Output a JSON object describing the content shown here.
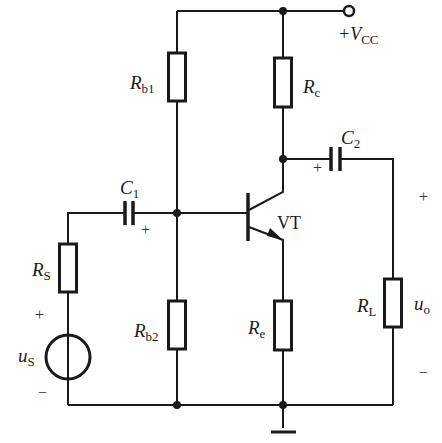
{
  "diagram": {
    "type": "circuit-schematic",
    "colors": {
      "ink": "#1a1a1a",
      "background": "#ffffff"
    },
    "labels": {
      "vcc": {
        "prefix": "+V",
        "sub": "CC"
      },
      "rb1": {
        "main": "R",
        "sub": "b1"
      },
      "rb2": {
        "main": "R",
        "sub": "b2"
      },
      "rc": {
        "main": "R",
        "sub": "c"
      },
      "re": {
        "main": "R",
        "sub": "e"
      },
      "rs": {
        "main": "R",
        "sub": "S"
      },
      "rl": {
        "main": "R",
        "sub": "L"
      },
      "c1": {
        "main": "C",
        "sub": "1"
      },
      "c2": {
        "main": "C",
        "sub": "2"
      },
      "vt": "VT",
      "us": {
        "main": "u",
        "sub": "S"
      },
      "uo": {
        "main": "u",
        "sub": "o"
      }
    },
    "polarity": {
      "c1_plus": "+",
      "c2_plus": "+",
      "us_plus": "+",
      "us_minus": "−",
      "uo_plus": "+",
      "uo_minus": "−"
    },
    "components": [
      {
        "id": "Rb1",
        "kind": "resistor",
        "connects": [
          "+VCC",
          "base"
        ]
      },
      {
        "id": "Rb2",
        "kind": "resistor",
        "connects": [
          "base",
          "ground"
        ]
      },
      {
        "id": "Rc",
        "kind": "resistor",
        "connects": [
          "+VCC",
          "collector"
        ]
      },
      {
        "id": "Re",
        "kind": "resistor",
        "connects": [
          "emitter",
          "ground"
        ]
      },
      {
        "id": "Rs",
        "kind": "resistor",
        "connects": [
          "us",
          "C1"
        ]
      },
      {
        "id": "RL",
        "kind": "resistor",
        "connects": [
          "C2",
          "ground"
        ]
      },
      {
        "id": "C1",
        "kind": "capacitor",
        "connects": [
          "Rs",
          "base"
        ]
      },
      {
        "id": "C2",
        "kind": "capacitor",
        "connects": [
          "collector",
          "RL"
        ]
      },
      {
        "id": "VT",
        "kind": "npn-transistor"
      },
      {
        "id": "us",
        "kind": "voltage-source"
      }
    ]
  }
}
